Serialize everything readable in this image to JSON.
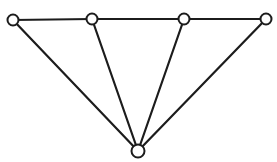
{
  "canvas": {
    "width": 277,
    "height": 162,
    "background": "#ffffff"
  },
  "graph": {
    "stroke_color": "#1c1c1c",
    "node_fill": "#ffffff",
    "edge_width": 2.2,
    "node_stroke_width": 2,
    "nodes": [
      {
        "id": "top-1",
        "x": 13,
        "y": 20,
        "r": 5.5
      },
      {
        "id": "top-2",
        "x": 92,
        "y": 19,
        "r": 5.5
      },
      {
        "id": "top-3",
        "x": 184,
        "y": 19,
        "r": 5.5
      },
      {
        "id": "top-4",
        "x": 266,
        "y": 19,
        "r": 5.5
      },
      {
        "id": "apex",
        "x": 138,
        "y": 151,
        "r": 6.5
      }
    ],
    "edges": [
      [
        "top-1",
        "top-2"
      ],
      [
        "top-2",
        "top-3"
      ],
      [
        "top-3",
        "top-4"
      ],
      [
        "apex",
        "top-1"
      ],
      [
        "apex",
        "top-2"
      ],
      [
        "apex",
        "top-3"
      ],
      [
        "apex",
        "top-4"
      ]
    ]
  }
}
